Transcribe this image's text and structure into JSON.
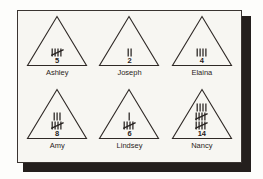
{
  "page": {
    "background_color": "#f7f6f2",
    "frame_color": "#3a3431",
    "shadow_color": "#241f1d",
    "ink_color": "#272220"
  },
  "chart_data": {
    "type": "table",
    "title": "",
    "categories": [
      "Ashley",
      "Joseph",
      "Elaina",
      "Amy",
      "Lindsey",
      "Nancy"
    ],
    "values": [
      5,
      2,
      4,
      8,
      6,
      14
    ],
    "xlabel": "",
    "ylabel": ""
  },
  "cells": [
    {
      "name": "Ashley",
      "count": "5",
      "tally_rows": [
        {
          "groups_of_five": 1,
          "singles": 0
        }
      ]
    },
    {
      "name": "Joseph",
      "count": "2",
      "tally_rows": [
        {
          "groups_of_five": 0,
          "singles": 2
        }
      ]
    },
    {
      "name": "Elaina",
      "count": "4",
      "tally_rows": [
        {
          "groups_of_five": 0,
          "singles": 4
        }
      ]
    },
    {
      "name": "Amy",
      "count": "8",
      "tally_rows": [
        {
          "groups_of_five": 0,
          "singles": 3
        },
        {
          "groups_of_five": 1,
          "singles": 0
        }
      ]
    },
    {
      "name": "Lindsey",
      "count": "6",
      "tally_rows": [
        {
          "groups_of_five": 0,
          "singles": 1
        },
        {
          "groups_of_five": 1,
          "singles": 0
        }
      ]
    },
    {
      "name": "Nancy",
      "count": "14",
      "tally_rows": [
        {
          "groups_of_five": 0,
          "singles": 4
        },
        {
          "groups_of_five": 1,
          "singles": 0
        },
        {
          "groups_of_five": 1,
          "singles": 0
        }
      ]
    }
  ]
}
